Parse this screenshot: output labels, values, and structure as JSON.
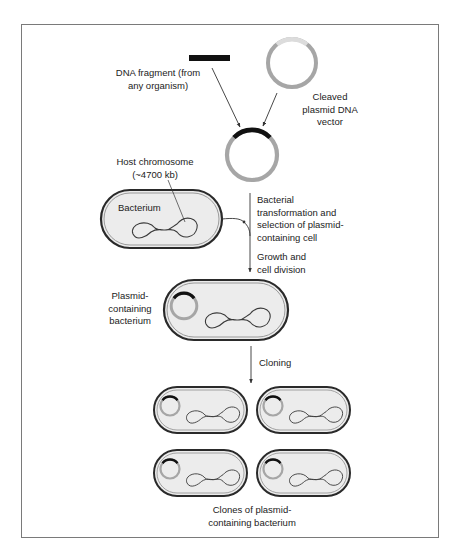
{
  "labels": {
    "dna_fragment": "DNA fragment (from\nany organism)",
    "cleaved_plasmid": "Cleaved\nplasmid DNA\nvector",
    "host_chromosome": "Host chromosome\n(~4700 kb)",
    "bacterium": "Bacterium",
    "transformation_step": "Bacterial\ntransformation and\nselection of plasmid-\ncontaining cell",
    "growth_step": "Growth and\ncell division",
    "plasmid_bacterium": "Plasmid-\ncontaining\nbacterium",
    "cloning_step": "Cloning",
    "clones": "Clones of plasmid-\ncontaining bacterium"
  },
  "colors": {
    "frame_border": "#7a7a7a",
    "dna_fragment": "#111111",
    "plasmid_grey": "#a6a6a6",
    "plasmid_light": "#d9d9d9",
    "cell_outline": "#2a2a2a",
    "cell_fill": "#ececec",
    "arrow": "#333333"
  }
}
